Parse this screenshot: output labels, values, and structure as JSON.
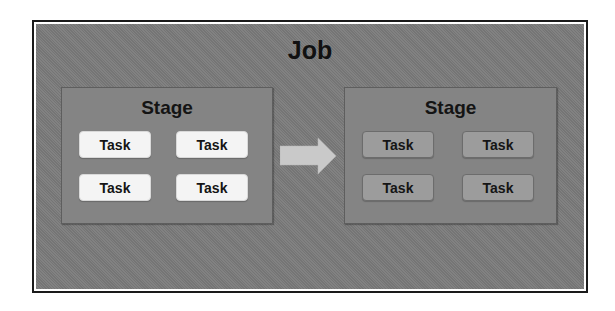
{
  "diagram": {
    "job": {
      "title": "Job"
    },
    "stages": [
      {
        "title": "Stage",
        "state": "active",
        "tasks": [
          "Task",
          "Task",
          "Task",
          "Task"
        ]
      },
      {
        "title": "Stage",
        "state": "pending",
        "tasks": [
          "Task",
          "Task",
          "Task",
          "Task"
        ]
      }
    ],
    "arrow": {
      "icon": "right-arrow-icon",
      "direction": "left-to-right"
    },
    "colors": {
      "frame_border": "#1a1a1a",
      "job_fill": "#7b7b7b",
      "stage_fill": "#848484",
      "active_task_fill": "#f4f4f4",
      "pending_task_fill": "#9c9c9c",
      "arrow_fill": "#c9c9c9",
      "text": "#141414"
    }
  }
}
